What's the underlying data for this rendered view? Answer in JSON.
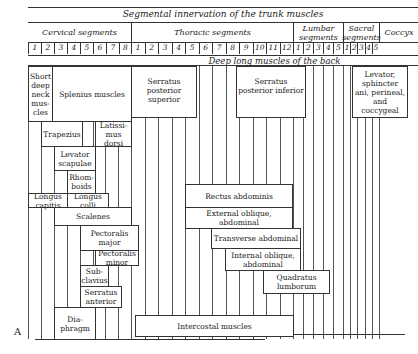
{
  "figure": {
    "label": "A",
    "title": "Segmental innervation of the trunk muscles",
    "deep_back_label": "Deep long muscles of the back"
  },
  "segment_groups": [
    {
      "name": "Cervical segments",
      "count": 8
    },
    {
      "name": "Thoracic segments",
      "count": 12
    },
    {
      "name": "Lumbar segments",
      "count": 5
    },
    {
      "name": "Sacral segments",
      "count": 5
    },
    {
      "name": "Coccyx",
      "count": 1
    }
  ],
  "segment_numbers": {
    "cervical": [
      "1",
      "2",
      "3",
      "4",
      "5",
      "6",
      "7",
      "8"
    ],
    "thoracic": [
      "1",
      "2",
      "3",
      "4",
      "5",
      "6",
      "7",
      "8",
      "9",
      "10",
      "11",
      "12"
    ],
    "lumbar": [
      "1",
      "2",
      "3",
      "4",
      "5"
    ],
    "sacral": [
      "1",
      "2",
      "3",
      "4",
      "5"
    ]
  },
  "muscles": {
    "short_deep_neck": "Short deep neck mus-cles",
    "splenius": "Splenius muscles",
    "serratus_post_sup": "Serratus posterior superior",
    "serratus_post_inf": "Serratus posterior inferior",
    "levator_sphincter": "Levator, sphincter ani, perineal, and coccygeal",
    "trapezius": "Trapezius",
    "latissimus": "Latissi-mus dorsi",
    "levator_scapulae": "Levator scapulae",
    "rhomboids": "Rhom-boids",
    "longus_capitis": "Longus capitis",
    "longus_colli": "Longus colli",
    "scalenes": "Scalenes",
    "pectoralis_major": "Pectoralis major",
    "pectoralis_minor": "Pectoralis minor",
    "subclavius": "Sub-clavius",
    "serratus_anterior": "Serratus anterior",
    "diaphragm": "Dia-phragm",
    "rectus_abdominis": "Rectus abdominis",
    "external_oblique": "External oblique, abdominal",
    "transverse": "Transverse abdominal",
    "internal_oblique": "Internal oblique, abdominal",
    "quadratus_lumborum": "Quadratus lumborum",
    "intercostal": "Intercostal muscles"
  }
}
